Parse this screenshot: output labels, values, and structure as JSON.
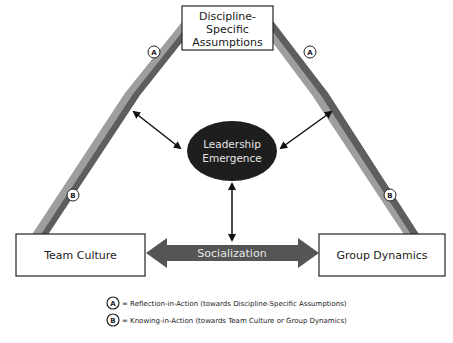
{
  "diagram": {
    "nodes": {
      "top": {
        "label_lines": [
          "Discipline-",
          "Specific",
          "Assumptions"
        ]
      },
      "left": {
        "label": "Team Culture"
      },
      "right": {
        "label": "Group Dynamics"
      },
      "center": {
        "label_lines": [
          "Leadership",
          "Emergence"
        ]
      }
    },
    "connector": {
      "label": "Socialization"
    },
    "markers": {
      "a_left": "A",
      "a_right": "A",
      "b_left": "B",
      "b_right": "B"
    },
    "legend": [
      {
        "marker": "A",
        "text": "= Reflection-in-Action (towards Discipline-Specific Assumptions)"
      },
      {
        "marker": "B",
        "text": "= Knowing-in-Action (towards Team Culture or Group Dynamics)"
      }
    ],
    "colors": {
      "ellipse_fill": "#1e1e1e",
      "banner_fill": "#555555",
      "diagonal_dark": "#5a5a5a",
      "diagonal_light": "#a8a8a8",
      "box_border": "#222222"
    }
  }
}
